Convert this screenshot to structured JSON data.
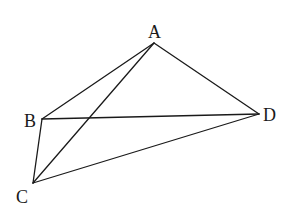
{
  "diagram": {
    "type": "geometry",
    "stroke_color": "#1a1a1a",
    "background": "#ffffff",
    "points": {
      "A": {
        "label": "A",
        "x": 154,
        "y": 43,
        "label_x": 148,
        "label_y": 38
      },
      "B": {
        "label": "B",
        "x": 42,
        "y": 119,
        "label_x": 24,
        "label_y": 127
      },
      "C": {
        "label": "C",
        "x": 33,
        "y": 183,
        "label_x": 16,
        "label_y": 203
      },
      "D": {
        "label": "D",
        "x": 259,
        "y": 114,
        "label_x": 263,
        "label_y": 121
      }
    },
    "segments": [
      {
        "name": "AB",
        "from": "A",
        "to": "B"
      },
      {
        "name": "AC",
        "from": "A",
        "to": "C"
      },
      {
        "name": "AD",
        "from": "A",
        "to": "D"
      },
      {
        "name": "BC",
        "from": "B",
        "to": "C"
      },
      {
        "name": "BD",
        "from": "B",
        "to": "D"
      },
      {
        "name": "CD",
        "from": "C",
        "to": "D"
      }
    ]
  }
}
